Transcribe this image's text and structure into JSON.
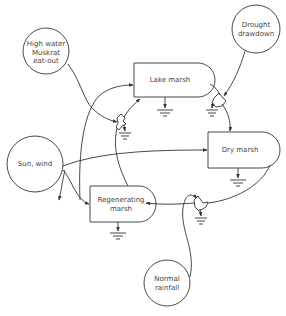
{
  "diagram": {
    "type": "energy-circuit / state-transition diagram of marsh states",
    "sources": [
      {
        "id": "high-water",
        "label_lines": [
          "High water",
          "Muskrat",
          "eat-out"
        ]
      },
      {
        "id": "drought",
        "label_lines": [
          "Drought",
          "drawdown"
        ]
      },
      {
        "id": "sun-wind",
        "label_lines": [
          "Sun, wind"
        ]
      },
      {
        "id": "normal-rainfall",
        "label_lines": [
          "Normal",
          "rainfall"
        ]
      }
    ],
    "storages": [
      {
        "id": "lake-marsh",
        "label_lines": [
          "Lake marsh"
        ]
      },
      {
        "id": "dry-marsh",
        "label_lines": [
          "Dry marsh"
        ]
      },
      {
        "id": "regenerating-marsh",
        "label_lines": [
          "Regenerating",
          "marsh"
        ]
      }
    ],
    "flows": [
      {
        "from": "high-water",
        "to": "switch-1",
        "via": "interaction"
      },
      {
        "from": "regenerating-marsh",
        "to": "switch-1"
      },
      {
        "from": "switch-1",
        "to": "lake-marsh"
      },
      {
        "from": "sun-wind",
        "to": "lake-marsh"
      },
      {
        "from": "lake-marsh",
        "to": "switch-2"
      },
      {
        "from": "drought",
        "to": "switch-2"
      },
      {
        "from": "switch-2",
        "to": "dry-marsh"
      },
      {
        "from": "sun-wind",
        "to": "dry-marsh"
      },
      {
        "from": "dry-marsh",
        "to": "switch-3"
      },
      {
        "from": "normal-rainfall",
        "to": "switch-3"
      },
      {
        "from": "switch-3",
        "to": "regenerating-marsh"
      },
      {
        "from": "sun-wind",
        "to": "regenerating-marsh"
      }
    ]
  },
  "labels": {
    "high_water_1": "High water",
    "high_water_2": "Muskrat",
    "high_water_3": "eat-out",
    "drought_1": "Drought",
    "drought_2": "drawdown",
    "sun_wind": "Sun, wind",
    "rainfall_1": "Normal",
    "rainfall_2": "rainfall",
    "lake_marsh": "Lake marsh",
    "dry_marsh": "Dry marsh",
    "regen_1": "Regenerating",
    "regen_2": "marsh"
  },
  "colors": {
    "stroke": "#333333",
    "text": "#444444",
    "background": "#ffffff"
  }
}
